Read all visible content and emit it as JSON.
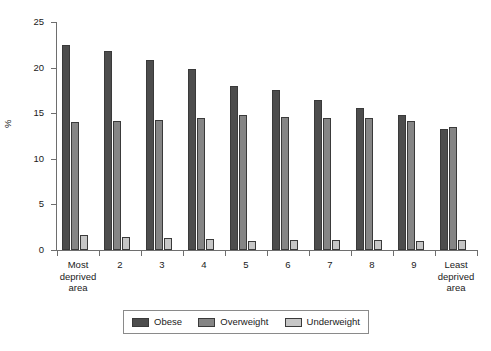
{
  "chart_data": {
    "type": "bar",
    "title": "",
    "xlabel": "",
    "ylabel": "%",
    "ylim": [
      0,
      25
    ],
    "yticks": [
      0,
      5,
      10,
      15,
      20,
      25
    ],
    "ytick_labels": [
      "0",
      "5",
      "10",
      "15",
      "20",
      "25"
    ],
    "grid": false,
    "legend_position": "bottom",
    "categories": [
      "Most deprived area",
      "2",
      "3",
      "4",
      "5",
      "6",
      "7",
      "8",
      "9",
      "Least deprived area"
    ],
    "category_lines": [
      [
        "Most",
        "deprived",
        "area"
      ],
      [
        "2"
      ],
      [
        "3"
      ],
      [
        "4"
      ],
      [
        "5"
      ],
      [
        "6"
      ],
      [
        "7"
      ],
      [
        "8"
      ],
      [
        "9"
      ],
      [
        "Least",
        "deprived",
        "area"
      ]
    ],
    "series": [
      {
        "name": "Obese",
        "color": "#4d4d4d",
        "values": [
          22.5,
          21.8,
          20.8,
          19.8,
          18.0,
          17.6,
          16.5,
          15.6,
          14.8,
          13.3
        ]
      },
      {
        "name": "Overweight",
        "color": "#858585",
        "values": [
          14.0,
          14.2,
          14.3,
          14.5,
          14.8,
          14.6,
          14.5,
          14.5,
          14.1,
          13.5
        ]
      },
      {
        "name": "Underweight",
        "color": "#c6c6c6",
        "values": [
          1.7,
          1.4,
          1.3,
          1.2,
          1.0,
          1.05,
          1.15,
          1.05,
          1.0,
          1.15
        ]
      }
    ]
  },
  "legend": {
    "items": [
      {
        "label": "Obese",
        "key": "obese"
      },
      {
        "label": "Overweight",
        "key": "overweight"
      },
      {
        "label": "Underweight",
        "key": "underweight"
      }
    ]
  }
}
